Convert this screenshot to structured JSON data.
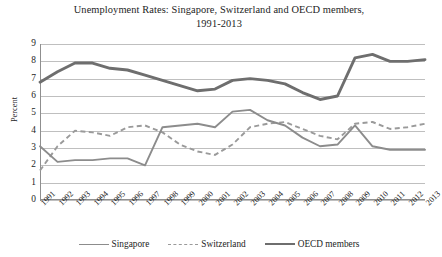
{
  "chart_data": {
    "type": "line",
    "title": "Unemployment Rates: Singapore, Switzerland and OECD members, 1991-2013",
    "title_line1": "Unemployment Rates: Singapore, Switzerland and OECD members,",
    "title_line2": "1991-2013",
    "xlabel": "",
    "ylabel": "Percent",
    "ylim": [
      0,
      9
    ],
    "yticks": [
      9,
      8,
      7,
      6,
      5,
      4,
      3,
      2,
      1,
      0
    ],
    "grid": true,
    "legend_position": "bottom",
    "categories": [
      "1991",
      "1992",
      "1993",
      "1994",
      "1995",
      "1996",
      "1997",
      "1998",
      "1999",
      "2000",
      "2001",
      "2002",
      "2003",
      "2004",
      "2005",
      "2006",
      "2007",
      "2008",
      "2009",
      "2010",
      "2011",
      "2012",
      "2013"
    ],
    "series": [
      {
        "name": "Singapore",
        "style": "solid",
        "color": "#8c8c8c",
        "values": [
          3.1,
          2.2,
          2.3,
          2.3,
          2.4,
          2.4,
          2.0,
          4.2,
          4.3,
          4.4,
          4.2,
          5.1,
          5.2,
          4.6,
          4.3,
          3.6,
          3.1,
          3.2,
          4.3,
          3.1,
          2.9,
          2.9,
          2.9
        ]
      },
      {
        "name": "Switzerland",
        "style": "dashed",
        "color": "#9a9a9a",
        "values": [
          1.7,
          3.1,
          4.0,
          3.9,
          3.7,
          4.2,
          4.3,
          3.9,
          3.2,
          2.8,
          2.6,
          3.2,
          4.2,
          4.4,
          4.5,
          4.1,
          3.7,
          3.5,
          4.4,
          4.5,
          4.1,
          4.2,
          4.4
        ]
      },
      {
        "name": "OECD members",
        "style": "solid-thick",
        "color": "#6e6e6e",
        "values": [
          6.8,
          7.4,
          7.9,
          7.9,
          7.6,
          7.5,
          7.2,
          6.9,
          6.6,
          6.3,
          6.4,
          6.9,
          7.0,
          6.9,
          6.7,
          6.2,
          5.8,
          6.0,
          8.2,
          8.4,
          8.0,
          8.0,
          8.1
        ]
      }
    ]
  },
  "legend": {
    "items": [
      {
        "label": "Singapore"
      },
      {
        "label": "Switzerland"
      },
      {
        "label": "OECD members"
      }
    ]
  }
}
